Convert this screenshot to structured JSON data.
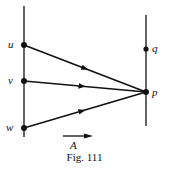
{
  "figure": {
    "caption": "Fig. 111",
    "colors": {
      "ink": "#111111",
      "background": "#ffffff"
    },
    "points": {
      "u": {
        "label": "u",
        "x": 24,
        "y": 45
      },
      "v": {
        "label": "v",
        "x": 24,
        "y": 81
      },
      "w": {
        "label": "w",
        "x": 24,
        "y": 128
      },
      "q": {
        "label": "q",
        "x": 146,
        "y": 49
      },
      "p": {
        "label": "p",
        "x": 146,
        "y": 92
      }
    },
    "lines": {
      "left": {
        "x": 24,
        "y1": 6,
        "y2": 137
      },
      "right": {
        "x": 146,
        "y1": 15,
        "y2": 126
      }
    },
    "arrows": [
      {
        "from": "u",
        "to": "p"
      },
      {
        "from": "v",
        "to": "p"
      },
      {
        "from": "w",
        "to": "p"
      }
    ],
    "direction_arrow": {
      "label": "A",
      "x1": 63,
      "x2": 92,
      "y": 136
    }
  }
}
